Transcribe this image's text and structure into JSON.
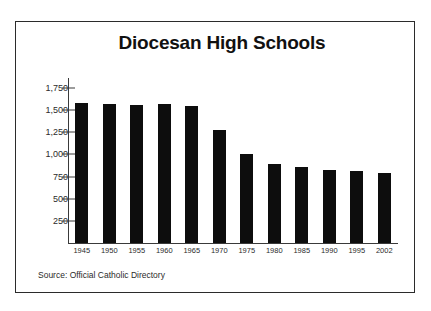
{
  "clipped_top_text": "",
  "chart_frame": {
    "source_note": "Source: Official Catholic Directory"
  },
  "chart_data": {
    "type": "bar",
    "title": "Diocesan High Schools",
    "xlabel": "",
    "ylabel": "",
    "categories": [
      "1945",
      "1950",
      "1955",
      "1960",
      "1965",
      "1970",
      "1975",
      "1980",
      "1985",
      "1990",
      "1995",
      "2002"
    ],
    "values": [
      1580,
      1570,
      1560,
      1565,
      1545,
      1275,
      1000,
      890,
      855,
      825,
      815,
      790
    ],
    "ytick_labels": [
      "1,750",
      "1,500",
      "1,250",
      "1,000",
      "750",
      "500",
      "250"
    ],
    "ytick_values": [
      1750,
      1500,
      1250,
      1000,
      750,
      500,
      250
    ],
    "ylim": [
      0,
      1875
    ],
    "grid": false,
    "legend": false,
    "bar_color": "#0d0d0d",
    "axis_color": "#3a3a3a",
    "background": "#ffffff"
  }
}
